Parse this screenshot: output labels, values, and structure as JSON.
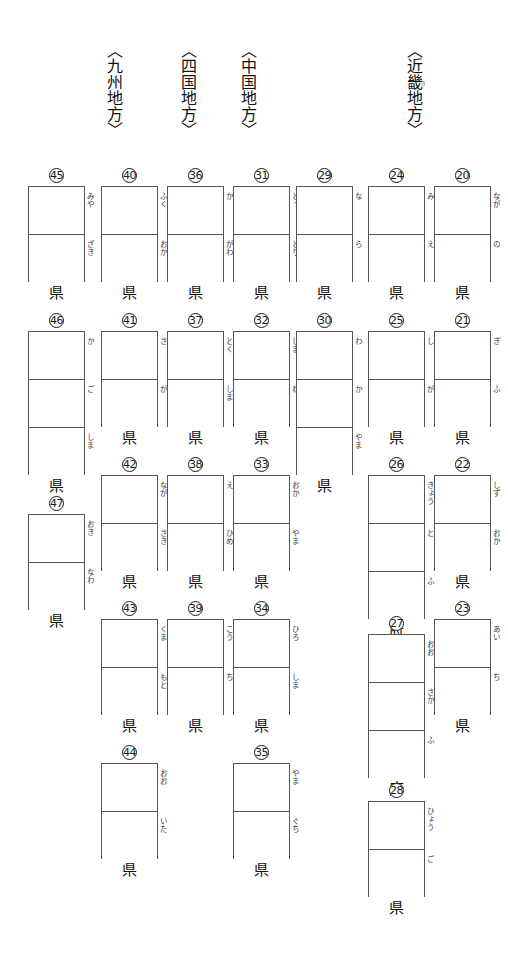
{
  "page": {
    "background_color": "#ffffff",
    "box_border_color": "#555555",
    "text_color": "#1a1a1a"
  },
  "regions": [
    {
      "id": "kyushu",
      "label": "〈九州地方〉",
      "base": "九州地方",
      "ruby": "",
      "x": 104,
      "y": 42
    },
    {
      "id": "shikoku",
      "label": "〈四国地方〉",
      "base": "四国地方",
      "ruby": "",
      "x": 178,
      "y": 42
    },
    {
      "id": "chugoku",
      "label": "〈中国地方〉",
      "base": "中国地方",
      "ruby": "",
      "x": 238,
      "y": 42
    },
    {
      "id": "kinki",
      "label": "〈近畿地方〉",
      "base": "近畿地方",
      "ruby": "き",
      "x": 404,
      "y": 42
    }
  ],
  "prefectures": [
    {
      "num": "45",
      "name": "宮崎",
      "hints": [
        "みや",
        "ざき"
      ],
      "suffix": "県",
      "x": 28,
      "y": 168,
      "cells": 2
    },
    {
      "num": "40",
      "name": "福岡",
      "hints": [
        "ふく",
        "おか"
      ],
      "suffix": "県",
      "x": 101,
      "y": 168,
      "cells": 2
    },
    {
      "num": "36",
      "name": "香川",
      "hints": [
        "か",
        "がわ"
      ],
      "suffix": "県",
      "x": 167,
      "y": 168,
      "cells": 2
    },
    {
      "num": "31",
      "name": "鳥取",
      "hints": [
        "とっ",
        "とり"
      ],
      "suffix": "県",
      "x": 233,
      "y": 168,
      "cells": 2
    },
    {
      "num": "29",
      "name": "奈良",
      "hints": [
        "な",
        "ら"
      ],
      "suffix": "県",
      "x": 296,
      "y": 168,
      "cells": 2
    },
    {
      "num": "24",
      "name": "三重",
      "hints": [
        "み",
        "え"
      ],
      "suffix": "県",
      "x": 368,
      "y": 168,
      "cells": 2
    },
    {
      "num": "20",
      "name": "長野",
      "hints": [
        "なが",
        "の"
      ],
      "suffix": "県",
      "x": 434,
      "y": 168,
      "cells": 2
    },
    {
      "num": "46",
      "name": "鹿児島",
      "hints": [
        "か",
        "ご",
        "しま"
      ],
      "suffix": "県",
      "x": 28,
      "y": 313,
      "cells": 3
    },
    {
      "num": "41",
      "name": "佐賀",
      "hints": [
        "さ",
        "が"
      ],
      "suffix": "県",
      "x": 101,
      "y": 313,
      "cells": 2
    },
    {
      "num": "37",
      "name": "徳島",
      "hints": [
        "とく",
        "しま"
      ],
      "suffix": "県",
      "x": 167,
      "y": 313,
      "cells": 2
    },
    {
      "num": "32",
      "name": "島根",
      "hints": [
        "しま",
        "ね"
      ],
      "suffix": "県",
      "x": 233,
      "y": 313,
      "cells": 2
    },
    {
      "num": "30",
      "name": "和歌山",
      "hints": [
        "わ",
        "か",
        "やま"
      ],
      "suffix": "県",
      "x": 296,
      "y": 313,
      "cells": 3
    },
    {
      "num": "25",
      "name": "滋賀",
      "hints": [
        "し",
        "が"
      ],
      "suffix": "県",
      "x": 368,
      "y": 313,
      "cells": 2
    },
    {
      "num": "21",
      "name": "岐阜",
      "hints": [
        "ぎ",
        "ふ"
      ],
      "suffix": "県",
      "x": 434,
      "y": 313,
      "cells": 2
    },
    {
      "num": "47",
      "name": "沖縄",
      "hints": [
        "おき",
        "なわ"
      ],
      "suffix": "県",
      "x": 28,
      "y": 496,
      "cells": 2
    },
    {
      "num": "42",
      "name": "長崎",
      "hints": [
        "なが",
        "さき"
      ],
      "suffix": "県",
      "x": 101,
      "y": 457,
      "cells": 2
    },
    {
      "num": "38",
      "name": "愛媛",
      "hints": [
        "え",
        "ひめ"
      ],
      "suffix": "県",
      "x": 167,
      "y": 457,
      "cells": 2
    },
    {
      "num": "33",
      "name": "岡山",
      "hints": [
        "おか",
        "やま"
      ],
      "suffix": "県",
      "x": 233,
      "y": 457,
      "cells": 2
    },
    {
      "num": "26",
      "name": "京都",
      "hints": [
        "きょう",
        "と",
        "ふ"
      ],
      "suffix": "府",
      "x": 368,
      "y": 457,
      "cells": 3
    },
    {
      "num": "22",
      "name": "静岡",
      "hints": [
        "しず",
        "おか"
      ],
      "suffix": "県",
      "x": 434,
      "y": 457,
      "cells": 2
    },
    {
      "num": "43",
      "name": "熊本",
      "hints": [
        "くま",
        "もと"
      ],
      "suffix": "県",
      "x": 101,
      "y": 601,
      "cells": 2
    },
    {
      "num": "39",
      "name": "高知",
      "hints": [
        "こう",
        "ち"
      ],
      "suffix": "県",
      "x": 167,
      "y": 601,
      "cells": 2
    },
    {
      "num": "34",
      "name": "広島",
      "hints": [
        "ひろ",
        "しま"
      ],
      "suffix": "県",
      "x": 233,
      "y": 601,
      "cells": 2
    },
    {
      "num": "27",
      "name": "大阪",
      "hints": [
        "おお",
        "さか",
        "ふ"
      ],
      "suffix": "府",
      "x": 368,
      "y": 616,
      "cells": 3
    },
    {
      "num": "23",
      "name": "愛知",
      "hints": [
        "あい",
        "ち"
      ],
      "suffix": "県",
      "x": 434,
      "y": 601,
      "cells": 2
    },
    {
      "num": "44",
      "name": "大分",
      "hints": [
        "おお",
        "いた"
      ],
      "suffix": "県",
      "x": 101,
      "y": 745,
      "cells": 2
    },
    {
      "num": "35",
      "name": "山口",
      "hints": [
        "やま",
        "ぐち"
      ],
      "suffix": "県",
      "x": 233,
      "y": 745,
      "cells": 2
    },
    {
      "num": "28",
      "name": "兵庫",
      "hints": [
        "ひょう",
        "ご"
      ],
      "suffix": "県",
      "x": 368,
      "y": 783,
      "cells": 2
    }
  ]
}
